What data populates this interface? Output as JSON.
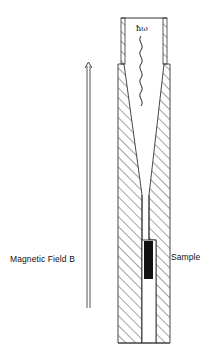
{
  "diagram": {
    "type": "schematic",
    "labels": {
      "magnetic_field": "Magnetic Field B",
      "sample": "Sample",
      "photon": "ħω"
    },
    "elements": [
      {
        "name": "magnetic-field-arrow",
        "direction": "up"
      },
      {
        "name": "waveguide-tube",
        "note": "thin-walled top section"
      },
      {
        "name": "light-cone",
        "note": "hatched tapering concentrator"
      },
      {
        "name": "photon-wave",
        "note": "wavy line indicating incident radiation"
      },
      {
        "name": "sample",
        "note": "solid black block"
      }
    ],
    "colors": {
      "line": "#222222",
      "sample_fill": "#111111",
      "background": "#ffffff"
    }
  }
}
